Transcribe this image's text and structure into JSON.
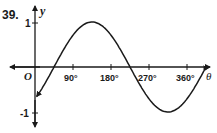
{
  "problem_number": "39.",
  "chart_data": {
    "type": "line",
    "title": "",
    "function": "y = sin(θ − 45°)",
    "xlabel": "θ",
    "ylabel": "y",
    "origin_label": "O",
    "x_ticks": [
      "90°",
      "180°",
      "270°",
      "360°"
    ],
    "x_tick_values": [
      90,
      180,
      270,
      360
    ],
    "y_ticks": [
      "1",
      "-1"
    ],
    "y_tick_values": [
      1,
      -1
    ],
    "xlim": [
      -45,
      405
    ],
    "ylim": [
      -1.1,
      1.1
    ],
    "grid": false,
    "legend": null,
    "series": [
      {
        "name": "curve",
        "x": [
          0,
          45,
          90,
          135,
          180,
          225,
          270,
          315,
          360,
          405
        ],
        "values": [
          -0.71,
          0,
          0.71,
          1,
          0.71,
          0,
          -0.71,
          -1,
          -0.71,
          0
        ]
      }
    ],
    "features": {
      "maximum": {
        "x": 135,
        "y": 1
      },
      "minimum": {
        "x": 315,
        "y": -1
      },
      "zeros": [
        45,
        225
      ],
      "arrows_on_curve_ends": true
    }
  },
  "colors": {
    "ink": "#1a1a1a",
    "background": "#ffffff"
  }
}
